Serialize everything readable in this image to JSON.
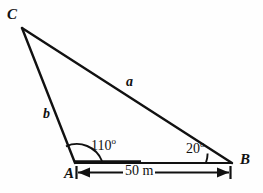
{
  "figure": {
    "type": "triangle-diagram",
    "background_color": "#fefefe",
    "stroke_color": "#111111",
    "vertices": {
      "C": {
        "label": "C",
        "x": 22,
        "y": 28
      },
      "A": {
        "label": "A",
        "x": 75,
        "y": 163
      },
      "B": {
        "label": "B",
        "x": 232,
        "y": 163
      }
    },
    "sides": [
      {
        "name": "side-a",
        "label": "a",
        "from": "C",
        "to": "B"
      },
      {
        "name": "side-b",
        "label": "b",
        "from": "C",
        "to": "A"
      },
      {
        "name": "side-c",
        "label": "",
        "from": "A",
        "to": "B"
      }
    ],
    "angles": [
      {
        "name": "angle-at-a",
        "value": "110",
        "degree_symbol": "o",
        "text": "110o",
        "at": "A"
      },
      {
        "name": "angle-at-b",
        "value": "20",
        "degree_symbol": "o",
        "text": "20o",
        "at": "B"
      }
    ],
    "dimension": {
      "label": "50 m",
      "value": "50",
      "unit": "m",
      "from": "A",
      "to": "B"
    }
  }
}
